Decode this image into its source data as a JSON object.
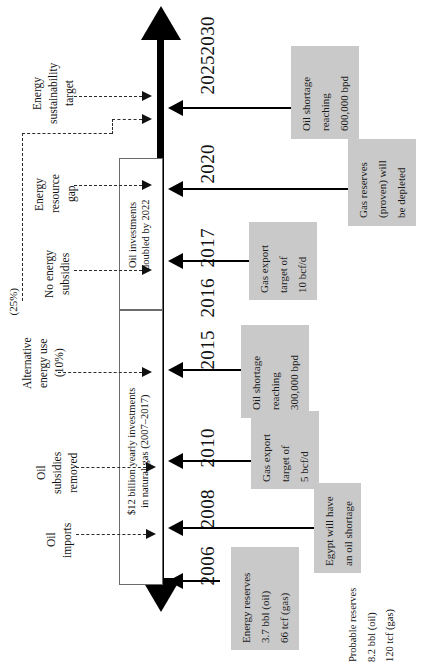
{
  "diagram": {
    "orientation": "rotated-90",
    "accent_gray": "#c9c9c9",
    "line_color": "#000000"
  },
  "timeline": {
    "axis_label": "Years",
    "years": [
      {
        "label": "2030",
        "y": 44
      },
      {
        "label": "2025",
        "y": 110
      },
      {
        "label": "2020",
        "y": 190
      },
      {
        "label": "2017",
        "y": 262
      },
      {
        "label": "2016",
        "y": 312
      },
      {
        "label": "2015",
        "y": 362
      },
      {
        "label": "2010",
        "y": 460
      },
      {
        "label": "2008",
        "y": 520
      },
      {
        "label": "2006",
        "y": 578
      }
    ]
  },
  "phase_boxes": [
    {
      "name": "oil-investments",
      "label": "Oil investments\ndoubled by 2022"
    },
    {
      "name": "natural-gas-investments",
      "label": "$12 billion yearly investments\nin natural gas (2007–2017)"
    }
  ],
  "callouts": [
    {
      "name": "oil-shortage-2025",
      "year": "2025",
      "lines": [
        "Oil shortage",
        "reaching",
        "600,000 bpd"
      ]
    },
    {
      "name": "gas-reserves-depleted-2020",
      "year": "2020",
      "lines": [
        "Gas reserves",
        "(proven) will",
        "be depleted"
      ]
    },
    {
      "name": "gas-export-10bcf-2017",
      "year": "2017",
      "lines": [
        "Gas export",
        "target of",
        "10 bcf/d"
      ]
    },
    {
      "name": "oil-shortage-2015",
      "year": "2015",
      "lines": [
        "Oil shortage",
        "reaching",
        "300,000 bpd"
      ]
    },
    {
      "name": "gas-export-5bcf-2010",
      "year": "2010",
      "lines": [
        "Gas export",
        "target of",
        "5 bcf/d"
      ]
    },
    {
      "name": "egypt-oil-shortage-2008",
      "year": "2008",
      "lines": [
        "Egypt will have",
        "an oil shortage"
      ]
    },
    {
      "name": "energy-reserves-2006",
      "year": "2006",
      "lines": [
        "Energy reserves",
        "3.7 bbl (oil)",
        "66 tcf (gas)"
      ]
    }
  ],
  "drivers": [
    {
      "name": "energy-sustainability-target",
      "lines": [
        "Energy",
        "sustainability",
        "target"
      ]
    },
    {
      "name": "energy-resource-gap",
      "lines": [
        "Energy",
        "resource",
        "gap"
      ]
    },
    {
      "name": "no-energy-subsidies",
      "lines": [
        "No energy",
        "subsidies"
      ]
    },
    {
      "name": "alternative-energy-use",
      "lines": [
        "Alternative",
        "energy use",
        "(10%)"
      ]
    },
    {
      "name": "oil-subsidies-removed",
      "lines": [
        "Oil",
        "subsidies",
        "removed"
      ]
    },
    {
      "name": "oil-imports",
      "lines": [
        "Oil",
        "imports"
      ]
    }
  ],
  "annotations": {
    "alt_energy_share_2030": "(25%)",
    "probable_reserves": [
      "Probable reserves",
      "8.2 bbl (oil)",
      "120 tcf (gas)"
    ]
  }
}
